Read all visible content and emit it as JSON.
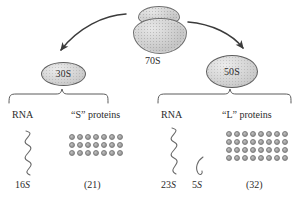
{
  "figure": {
    "type": "biology-diagram"
  },
  "ribosome": {
    "label": "70S",
    "icon": "ribosome-70s-icon"
  },
  "subunits": [
    {
      "id": "30s",
      "label": "30S",
      "rna_heading": "RNA",
      "protein_heading": "“S” proteins",
      "rna": [
        {
          "label": "16",
          "unit": "S",
          "shape": "zigzag-long"
        }
      ],
      "protein_count_label": "(21)",
      "protein_count": 21,
      "grid": {
        "columns": 7,
        "rows": 3
      }
    },
    {
      "id": "50s",
      "label": "50S",
      "rna_heading": "RNA",
      "protein_heading": "“L” proteins",
      "rna": [
        {
          "label": "23",
          "unit": "S",
          "shape": "zigzag-long"
        },
        {
          "label": "5",
          "unit": "S",
          "shape": "hook-short"
        }
      ],
      "protein_count_label": "(32)",
      "protein_count": 32,
      "grid": {
        "columns": 8,
        "rows": 4
      }
    }
  ],
  "arrows": [
    {
      "name": "arrow-to-30s",
      "direction": "down-left"
    },
    {
      "name": "arrow-to-50s",
      "direction": "down-right"
    }
  ],
  "colors": {
    "ink": "#2b2b2b",
    "stroke": "#4a4a4a",
    "subunit_fill": "#d4d4d4",
    "dot_fill": "#9b9b9b",
    "background": "#ffffff"
  }
}
